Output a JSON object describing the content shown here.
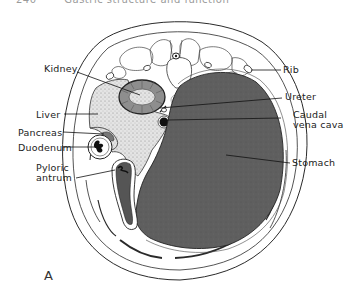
{
  "header": {
    "page_number": "240",
    "running_title": "Gastric structure and function"
  },
  "figure": {
    "panel_letter": "A",
    "colors": {
      "stomach_fill": "#5e5e5e",
      "liver_fill": "#d6d6d6",
      "line": "#2a2a2a",
      "background": "#ffffff"
    },
    "labels": {
      "kidney": "Kidney",
      "liver": "Liver",
      "pancreas": "Pancreas",
      "duodenum": "Duodenum",
      "pyloric_antrum": "Pyloric\nantrum",
      "rib": "Rib",
      "ureter": "Ureter",
      "caudal_vena_cava": "Caudal\nvena cava",
      "stomach": "Stomach"
    }
  }
}
